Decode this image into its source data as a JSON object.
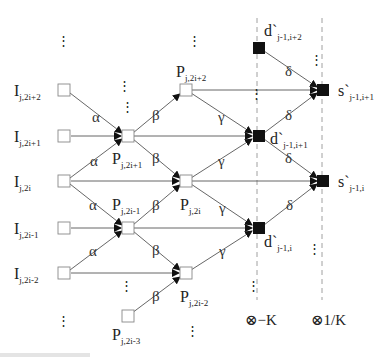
{
  "diagram": {
    "type": "lifting-scheme-signal-flow-graph",
    "input_nodes": [
      {
        "id": "I_2i+2",
        "label": "I",
        "sub": "j,2i+2"
      },
      {
        "id": "I_2i+1",
        "label": "I",
        "sub": "j,2i+1"
      },
      {
        "id": "I_2i",
        "label": "I",
        "sub": "j,2i"
      },
      {
        "id": "I_2i-1",
        "label": "I",
        "sub": "j,2i-1"
      },
      {
        "id": "I_2i-2",
        "label": "I",
        "sub": "j,2i-2"
      }
    ],
    "p_nodes": [
      {
        "id": "P_2i+2",
        "label": "P",
        "sub": "j,2i+2"
      },
      {
        "id": "P_2i+1",
        "label": "P",
        "sub": "j,2i+1"
      },
      {
        "id": "P_2i",
        "label": "P",
        "sub": "j,2i"
      },
      {
        "id": "P_2i-1",
        "label": "P",
        "sub": "j,2i-1"
      },
      {
        "id": "P_2i-2",
        "label": "P",
        "sub": "j,2i-2"
      },
      {
        "id": "P_2i-3",
        "label": "P",
        "sub": "j,2i-3"
      }
    ],
    "d_nodes": [
      {
        "id": "d_i+2",
        "label": "d`",
        "sub": "j-1,i+2"
      },
      {
        "id": "d_i+1",
        "label": "d`",
        "sub": "j-1,i+1"
      },
      {
        "id": "d_i",
        "label": "d`",
        "sub": "j-1,i"
      }
    ],
    "s_nodes": [
      {
        "id": "s_i+1",
        "label": "s`",
        "sub": "j-1,i+1"
      },
      {
        "id": "s_i",
        "label": "s`",
        "sub": "j-1,i"
      }
    ],
    "coefficients": {
      "alpha": "α",
      "beta": "β",
      "gamma": "γ",
      "delta": "δ"
    },
    "scaling": {
      "left": "⊗−K",
      "right": "⊗1/K"
    },
    "ellipsis": "⋮",
    "caption_truncated": ""
  },
  "colors": {
    "stroke": "#555555",
    "filled_node": "#111111",
    "open_node_border": "#888888",
    "dashed_line": "#888888"
  }
}
